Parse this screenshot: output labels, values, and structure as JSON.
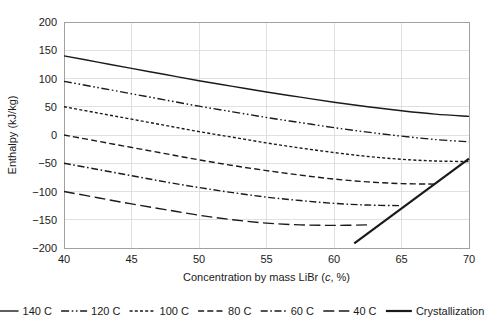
{
  "chart_data": {
    "type": "line",
    "title": "",
    "xlabel": "Concentration by mass LiBr (c, %)",
    "xlabel_parts": {
      "pre": "Concentration by mass LiBr (",
      "italic": "c",
      "post": ", %)"
    },
    "ylabel": "Enthalpy (kJ/kg)",
    "xlim": [
      40,
      70
    ],
    "ylim": [
      -200,
      200
    ],
    "xticks": [
      40,
      45,
      50,
      55,
      60,
      65,
      70
    ],
    "yticks": [
      -200,
      -150,
      -100,
      -50,
      0,
      50,
      100,
      150,
      200
    ],
    "xtick_labels": [
      "40",
      "45",
      "50",
      "55",
      "60",
      "65",
      "70"
    ],
    "ytick_labels": [
      "−200",
      "−150",
      "−100",
      "−50",
      "0",
      "50",
      "100",
      "150",
      "200"
    ],
    "grid": true,
    "legend_position": "below",
    "line_color": "#1a1a1a",
    "series": [
      {
        "name": "140 C",
        "label": "140 C",
        "dash": "none",
        "width": "normal",
        "x": [
          40,
          42.5,
          45,
          47.5,
          50,
          52.5,
          55,
          57.5,
          60,
          62.5,
          65,
          67.5,
          70
        ],
        "values": [
          140,
          129,
          118,
          107,
          96,
          86,
          76,
          67,
          58,
          50,
          43,
          37,
          33
        ]
      },
      {
        "name": "120 C",
        "label": "120 C",
        "dash": "dashdotdot",
        "width": "normal",
        "x": [
          40,
          42.5,
          45,
          47.5,
          50,
          52.5,
          55,
          57.5,
          60,
          62.5,
          65,
          67.5,
          70
        ],
        "values": [
          95,
          84,
          73,
          62,
          51,
          41,
          31,
          22,
          13,
          5,
          -2,
          -8,
          -12
        ]
      },
      {
        "name": "100 C",
        "label": "100 C",
        "dash": "dotted",
        "width": "normal",
        "x": [
          40,
          42.5,
          45,
          47.5,
          50,
          52.5,
          55,
          57.5,
          60,
          62.5,
          65,
          67.5,
          70
        ],
        "values": [
          50,
          39,
          28,
          17,
          6,
          -4,
          -14,
          -23,
          -31,
          -38,
          -43,
          -46,
          -47
        ]
      },
      {
        "name": "80 C",
        "label": "80 C",
        "dash": "dashed",
        "width": "normal",
        "x": [
          40,
          42.5,
          45,
          47.5,
          50,
          52.5,
          55,
          57.5,
          60,
          62.5,
          65,
          67.5
        ],
        "values": [
          0,
          -11,
          -22,
          -33,
          -44,
          -54,
          -63,
          -71,
          -78,
          -83,
          -86,
          -87
        ]
      },
      {
        "name": "60 C",
        "label": "60 C",
        "dash": "dashdot",
        "width": "normal",
        "x": [
          40,
          42.5,
          45,
          47.5,
          50,
          52.5,
          55,
          57.5,
          60,
          62.5,
          65
        ],
        "values": [
          -50,
          -61,
          -72,
          -83,
          -93,
          -102,
          -110,
          -116,
          -121,
          -124,
          -125
        ]
      },
      {
        "name": "40 C",
        "label": "40 C",
        "dash": "longdash",
        "width": "normal",
        "x": [
          40,
          42.5,
          45,
          47.5,
          50,
          52.5,
          55,
          57.5,
          60,
          62.5
        ],
        "values": [
          -100,
          -111,
          -122,
          -132,
          -142,
          -150,
          -156,
          -159,
          -160,
          -159
        ]
      },
      {
        "name": "Crystallization",
        "label": "Crystallization",
        "dash": "none",
        "width": "thick",
        "x": [
          61.5,
          70
        ],
        "values": [
          -192,
          -42
        ]
      }
    ]
  },
  "legend": {
    "items": [
      {
        "label": "140 C"
      },
      {
        "label": "120 C"
      },
      {
        "label": "100 C"
      },
      {
        "label": "80 C"
      },
      {
        "label": "60 C"
      },
      {
        "label": "40 C"
      },
      {
        "label": "Crystallization"
      }
    ]
  }
}
